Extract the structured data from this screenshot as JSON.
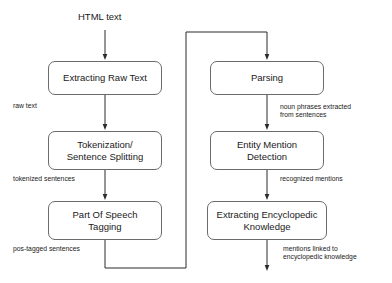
{
  "diagram": {
    "title_label": "HTML text",
    "nodes": [
      {
        "id": "extracting-raw-text",
        "label": "Extracting Raw Text"
      },
      {
        "id": "tokenization-sentence-splitting",
        "label": "Tokenization/\nSentence Splitting"
      },
      {
        "id": "part-of-speech-tagging",
        "label": "Part Of Speech\nTagging"
      },
      {
        "id": "parsing",
        "label": "Parsing"
      },
      {
        "id": "entity-mention-detection",
        "label": "Entity Mention\nDetection"
      },
      {
        "id": "extracting-encyclopedic-knowledge",
        "label": "Extracting Encyclopedic\nKnowledge"
      }
    ],
    "edge_labels": [
      {
        "id": "raw-text",
        "text": "raw text"
      },
      {
        "id": "tokenized-sentences",
        "text": "tokenized sentences"
      },
      {
        "id": "pos-tagged-sentences",
        "text": "pos-tagged sentences"
      },
      {
        "id": "noun-phrases-extracted",
        "text": "noun phrases extracted\nfrom sentences"
      },
      {
        "id": "recognized-mentions",
        "text": "recognized mentions"
      },
      {
        "id": "mentions-linked",
        "text": "mentions linked to\nencyclopedic knowledge"
      }
    ],
    "colors": {
      "node_border": "#6b6b6b",
      "edge_stroke": "#2b2b2b",
      "text": "#1a1a1a",
      "background": "#ffffff"
    }
  }
}
